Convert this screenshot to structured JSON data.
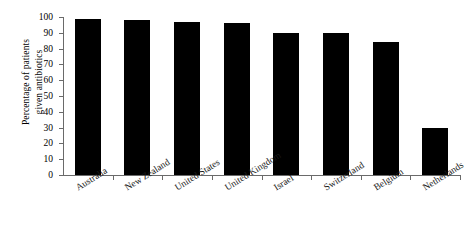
{
  "chart_data": {
    "type": "bar",
    "title": "",
    "xlabel": "",
    "ylabel": "Percentage of patients given antibiotics",
    "ylabel_line1": "Percentage of patients",
    "ylabel_line2": "given antibiotics",
    "categories": [
      "Australia",
      "New Zealand",
      "United States",
      "United Kingdom",
      "Israel",
      "Switzerland",
      "Belgium",
      "Netherlands"
    ],
    "values": [
      99,
      98,
      97,
      96,
      90,
      90,
      84,
      30
    ],
    "ylim": [
      0,
      100
    ],
    "yticks": [
      0,
      10,
      20,
      30,
      40,
      50,
      60,
      70,
      80,
      90,
      100
    ],
    "ytick_labels": [
      "0",
      "10",
      "20",
      "30",
      "40",
      "50",
      "60",
      "70",
      "80",
      "90",
      "100"
    ],
    "grid": false,
    "legend": false,
    "bar_color": "#000000",
    "axis_color": "#6a6a6a"
  }
}
